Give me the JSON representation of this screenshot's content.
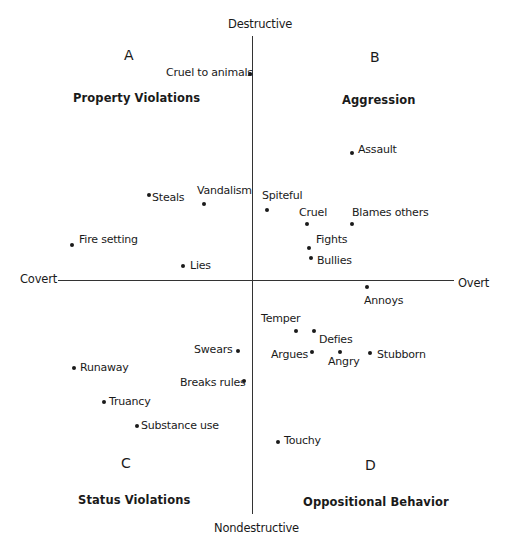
{
  "axes": {
    "top": "Destructive",
    "bottom": "Nondestructive",
    "left": "Covert",
    "right": "Overt"
  },
  "quadrants": [
    {
      "letter": "A",
      "title": "Property Violations"
    },
    {
      "letter": "B",
      "title": "Aggression"
    },
    {
      "letter": "C",
      "title": "Status Violations"
    },
    {
      "letter": "D",
      "title": "Oppositional Behavior"
    }
  ],
  "items": [
    {
      "label": "Cruel to animals"
    },
    {
      "label": "Assault"
    },
    {
      "label": "Steals"
    },
    {
      "label": "Vandalism"
    },
    {
      "label": "Spiteful"
    },
    {
      "label": "Cruel"
    },
    {
      "label": "Blames others"
    },
    {
      "label": "Fights"
    },
    {
      "label": "Bullies"
    },
    {
      "label": "Fire setting"
    },
    {
      "label": "Lies"
    },
    {
      "label": "Annoys"
    },
    {
      "label": "Temper"
    },
    {
      "label": "Defies"
    },
    {
      "label": "Argues"
    },
    {
      "label": "Angry"
    },
    {
      "label": "Stubborn"
    },
    {
      "label": "Swears"
    },
    {
      "label": "Runaway"
    },
    {
      "label": "Breaks rules"
    },
    {
      "label": "Truancy"
    },
    {
      "label": "Substance use"
    },
    {
      "label": "Touchy"
    }
  ]
}
